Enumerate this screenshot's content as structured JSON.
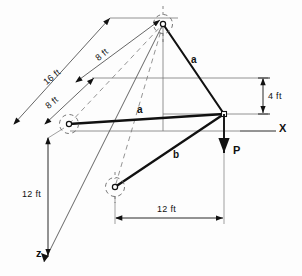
{
  "figure": {
    "background_color": "#fdfdfd",
    "line_color": "#111111",
    "thin_line_color": "#555555"
  },
  "dimensions": [
    {
      "id": "dim-16ft",
      "label": "16 ft",
      "x": 42,
      "y": 80,
      "rotated": true
    },
    {
      "id": "dim-8ft-upper",
      "label": "8 ft",
      "x": 94,
      "y": 56,
      "rotated": true
    },
    {
      "id": "dim-8ft-lower",
      "label": "8 ft",
      "x": 44,
      "y": 104,
      "rotated": true
    },
    {
      "id": "dim-4ft",
      "label": "4 ft",
      "x": 268,
      "y": 92,
      "rotated": false
    },
    {
      "id": "dim-12ft-vertical",
      "label": "12 ft",
      "x": 22,
      "y": 190,
      "rotated": false
    },
    {
      "id": "dim-12ft-horizontal",
      "label": "12 ft",
      "x": 157,
      "y": 205,
      "rotated": false
    }
  ],
  "members": [
    {
      "id": "member-a-upper",
      "label": "a",
      "x": 191,
      "y": 55
    },
    {
      "id": "member-a-lower",
      "label": "a",
      "x": 137,
      "y": 105
    },
    {
      "id": "member-b",
      "label": "b",
      "x": 173,
      "y": 150
    }
  ],
  "axes": [
    {
      "id": "axis-x",
      "label": "X",
      "x": 279,
      "y": 123
    },
    {
      "id": "axis-z",
      "label": "z",
      "x": 36,
      "y": 248
    }
  ],
  "load": {
    "id": "load-p",
    "label": "P",
    "x": 233,
    "y": 145,
    "direction": "down"
  },
  "nodes": [
    {
      "id": "node-top-support",
      "cx": 163,
      "cy": 24
    },
    {
      "id": "node-left-support",
      "cx": 69,
      "cy": 124
    },
    {
      "id": "node-lower-support",
      "cx": 115,
      "cy": 187
    },
    {
      "id": "node-apex",
      "cx": 224,
      "cy": 114
    }
  ]
}
